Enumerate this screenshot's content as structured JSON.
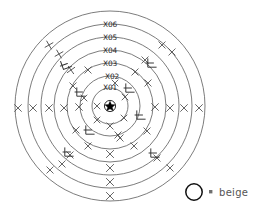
{
  "diagram": {
    "center": {
      "x": 110,
      "y": 106,
      "symbol": "star",
      "label": "center-star"
    },
    "rings": [
      {
        "id": "X01",
        "label": "X01",
        "radius": 18,
        "label_y": 90
      },
      {
        "id": "X02",
        "label": "X02",
        "radius": 30,
        "label_y": 79
      },
      {
        "id": "X03",
        "label": "X03",
        "radius": 43,
        "label_y": 66
      },
      {
        "id": "X04",
        "label": "X04",
        "radius": 56,
        "label_y": 53
      },
      {
        "id": "X05",
        "label": "X05",
        "radius": 69,
        "label_y": 40
      },
      {
        "id": "X06",
        "label": "X06",
        "radius": 82,
        "label_y": 27
      },
      {
        "id": "X07",
        "label": "",
        "radius": 95,
        "label_y": 0
      }
    ],
    "stroke_color": "#5a5a5a",
    "label_color": "#2a2a2a"
  },
  "marks": {
    "description": "hand-drawn X and L shaped tally marks scattered across the rings",
    "x_marks": [
      {
        "x": 18,
        "y": 108,
        "s": 3.4,
        "r": 0
      },
      {
        "x": 33,
        "y": 108,
        "s": 3.4,
        "r": 0
      },
      {
        "x": 49,
        "y": 108,
        "s": 3.4,
        "r": 0
      },
      {
        "x": 64,
        "y": 108,
        "s": 3.4,
        "r": 0
      },
      {
        "x": 79,
        "y": 107,
        "s": 3.4,
        "r": 0
      },
      {
        "x": 155,
        "y": 107,
        "s": 3.4,
        "r": 0
      },
      {
        "x": 170,
        "y": 108,
        "s": 3.4,
        "r": 0
      },
      {
        "x": 184,
        "y": 108,
        "s": 3.4,
        "r": 0
      },
      {
        "x": 199,
        "y": 108,
        "s": 3.4,
        "r": 0
      },
      {
        "x": 110,
        "y": 154,
        "s": 3.6,
        "r": 0
      },
      {
        "x": 110,
        "y": 168,
        "s": 3.6,
        "r": 0
      },
      {
        "x": 110,
        "y": 182,
        "s": 3.6,
        "r": 0
      },
      {
        "x": 110,
        "y": 196,
        "s": 3.6,
        "r": 0
      },
      {
        "x": 49,
        "y": 45,
        "s": 3.2,
        "r": 15
      },
      {
        "x": 59,
        "y": 54,
        "s": 3.2,
        "r": 15
      },
      {
        "x": 71,
        "y": 70,
        "s": 3.2,
        "r": 10
      },
      {
        "x": 88,
        "y": 70,
        "s": 3.2,
        "r": 0
      },
      {
        "x": 73,
        "y": 86,
        "s": 3.2,
        "r": 0
      },
      {
        "x": 84,
        "y": 98,
        "s": 3.0,
        "r": 0
      },
      {
        "x": 97,
        "y": 106,
        "s": 3.0,
        "r": 0
      },
      {
        "x": 97,
        "y": 120,
        "s": 3.0,
        "r": 0
      },
      {
        "x": 110,
        "y": 126,
        "s": 3.2,
        "r": 0
      },
      {
        "x": 124,
        "y": 118,
        "s": 3.0,
        "r": 0
      },
      {
        "x": 125,
        "y": 97,
        "s": 3.0,
        "r": 0
      },
      {
        "x": 115,
        "y": 83,
        "s": 3.0,
        "r": 0
      },
      {
        "x": 135,
        "y": 72,
        "s": 3.2,
        "r": 0
      },
      {
        "x": 148,
        "y": 83,
        "s": 3.2,
        "r": 0
      },
      {
        "x": 145,
        "y": 60,
        "s": 3.2,
        "r": 0
      },
      {
        "x": 162,
        "y": 45,
        "s": 3.2,
        "r": 0
      },
      {
        "x": 172,
        "y": 52,
        "s": 3.2,
        "r": 0
      },
      {
        "x": 76,
        "y": 130,
        "s": 3.2,
        "r": 0
      },
      {
        "x": 88,
        "y": 146,
        "s": 3.2,
        "r": 0
      },
      {
        "x": 70,
        "y": 155,
        "s": 3.2,
        "r": 0
      },
      {
        "x": 50,
        "y": 170,
        "s": 3.2,
        "r": 0
      },
      {
        "x": 62,
        "y": 164,
        "s": 3.2,
        "r": 0
      },
      {
        "x": 134,
        "y": 146,
        "s": 3.2,
        "r": 0
      },
      {
        "x": 147,
        "y": 131,
        "s": 3.2,
        "r": 0
      },
      {
        "x": 157,
        "y": 158,
        "s": 3.2,
        "r": 0
      },
      {
        "x": 170,
        "y": 168,
        "s": 3.2,
        "r": 0
      },
      {
        "x": 120,
        "y": 138,
        "s": 3.2,
        "r": 0
      },
      {
        "x": 118,
        "y": 135,
        "s": 3.2,
        "r": 0
      }
    ],
    "angle_marks": [
      {
        "x": 66,
        "y": 64,
        "r": -20
      },
      {
        "x": 81,
        "y": 92,
        "r": 0
      },
      {
        "x": 90,
        "y": 130,
        "r": 0
      },
      {
        "x": 130,
        "y": 88,
        "r": 0
      },
      {
        "x": 141,
        "y": 115,
        "r": 0
      },
      {
        "x": 152,
        "y": 63,
        "r": 0
      },
      {
        "x": 69,
        "y": 152,
        "r": 0
      },
      {
        "x": 155,
        "y": 153,
        "r": 0
      }
    ]
  },
  "legend": {
    "swatch_name": "circle-swatch",
    "equals": "=",
    "label": "beige",
    "swatch_color": "#111111",
    "text_color": "#555555"
  }
}
